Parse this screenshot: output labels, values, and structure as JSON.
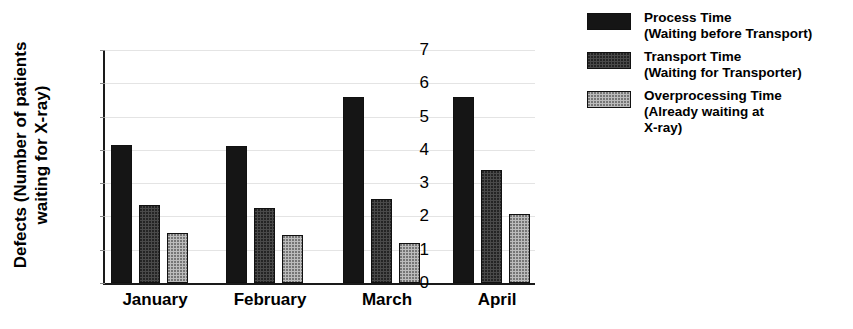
{
  "chart_data": {
    "type": "bar",
    "title": "",
    "xlabel": "",
    "ylabel": "Defects (Number of patients waiting for X-ray)",
    "ylabel_lines": [
      "Defects (Number of patients",
      "waiting for X-ray)"
    ],
    "categories": [
      "January",
      "February",
      "March",
      "April"
    ],
    "ylim": [
      0,
      7
    ],
    "yticks": [
      0,
      1,
      2,
      3,
      4,
      5,
      6,
      7
    ],
    "ytick_labels": [
      "0",
      "1",
      "2",
      "3",
      "4",
      "5",
      "6",
      "7"
    ],
    "grid": true,
    "legend_position": "right",
    "series": [
      {
        "name": "Process Time (Waiting before Transport)",
        "name_lines": [
          "Process Time",
          "(Waiting before Transport)"
        ],
        "color": "#151515",
        "values": [
          4.15,
          4.13,
          5.58,
          5.6
        ]
      },
      {
        "name": "Transport Time (Waiting for Transporter)",
        "name_lines": [
          "Transport Time",
          "(Waiting for Transporter)"
        ],
        "color": "#4a4a4a",
        "values": [
          2.35,
          2.25,
          2.52,
          3.4
        ]
      },
      {
        "name": "Overprocessing Time (Already waiting at X-ray)",
        "name_lines": [
          "Overprocessing Time",
          "(Already waiting at",
          "X-ray)"
        ],
        "color": "#bcbcbc",
        "values": [
          1.5,
          1.43,
          1.2,
          2.08
        ]
      }
    ]
  },
  "legend": {
    "items": [
      {
        "swatch": "process-time-swatch",
        "lines": [
          "Process Time",
          "(Waiting before Transport)"
        ]
      },
      {
        "swatch": "transport-time-swatch",
        "lines": [
          "Transport Time",
          "(Waiting for Transporter)"
        ]
      },
      {
        "swatch": "overprocessing-time-swatch",
        "lines": [
          "Overprocessing Time",
          "(Already waiting at",
          "X-ray)"
        ]
      }
    ]
  }
}
